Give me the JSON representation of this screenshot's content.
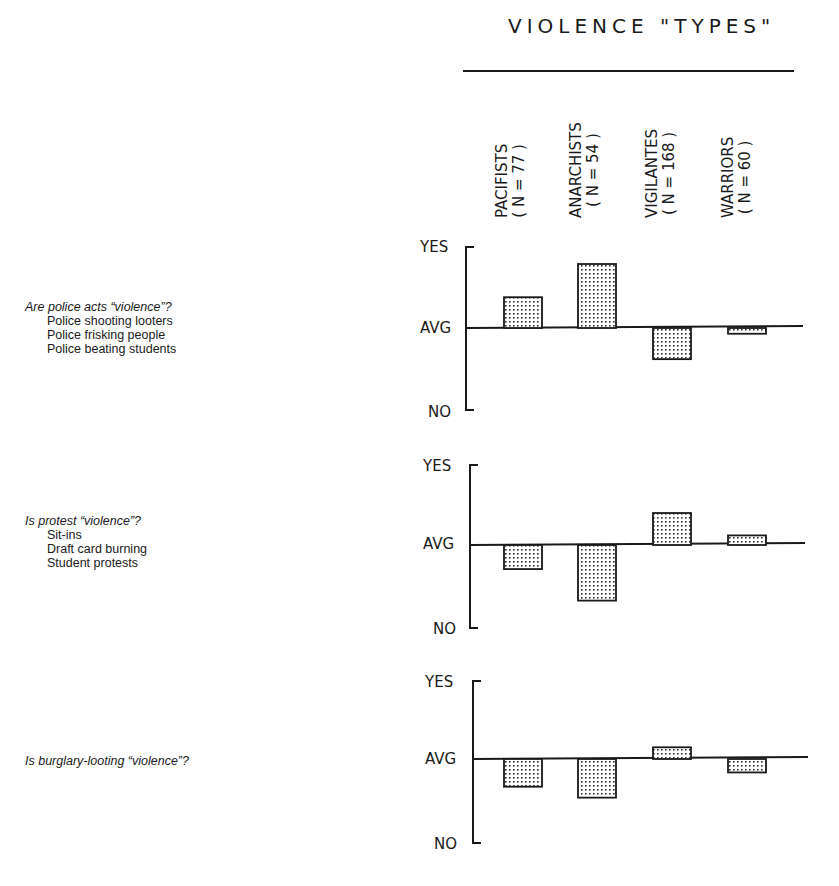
{
  "header": {
    "title": "VIOLENCE \"TYPES\""
  },
  "columns": [
    {
      "name": "PACIFISTS",
      "n": "( N = 77 )"
    },
    {
      "name": "ANARCHISTS",
      "n": "( N = 54 )"
    },
    {
      "name": "VIGILANTES",
      "n": "( N = 168 )"
    },
    {
      "name": "WARRIORS",
      "n": "( N = 60 )"
    }
  ],
  "axis_labels": {
    "yes": "YES",
    "avg": "AVG",
    "no": "NO"
  },
  "panels": [
    {
      "question": "Are police acts “violence”?",
      "items": [
        "Police shooting looters",
        "Police frisking people",
        "Police beating students"
      ]
    },
    {
      "question": "Is protest “violence”?",
      "items": [
        "Sit-ins",
        "Draft card burning",
        "Student protests"
      ]
    },
    {
      "question": "Is burglary-looting “violence”?",
      "items": []
    }
  ],
  "chart_data": [
    {
      "type": "bar",
      "title": "Are police acts \"violence\"?",
      "subtitle": "Police shooting looters; Police frisking people; Police beating students",
      "categories": [
        "Pacifists (N=77)",
        "Anarchists (N=54)",
        "Vigilantes (N=168)",
        "Warriors (N=60)"
      ],
      "values": [
        0.38,
        0.79,
        -0.38,
        -0.07
      ],
      "xlabel": "VIOLENCE \"TYPES\"",
      "ylabel": "",
      "yticks": [
        "NO",
        "AVG",
        "YES"
      ],
      "ylim": [
        -1,
        1
      ],
      "grid": false,
      "legend": "none"
    },
    {
      "type": "bar",
      "title": "Is protest \"violence\"?",
      "subtitle": "Sit-ins; Draft card burning; Student protests",
      "categories": [
        "Pacifists (N=77)",
        "Anarchists (N=54)",
        "Vigilantes (N=168)",
        "Warriors (N=60)"
      ],
      "values": [
        -0.29,
        -0.67,
        0.4,
        0.12
      ],
      "xlabel": "VIOLENCE \"TYPES\"",
      "ylabel": "",
      "yticks": [
        "NO",
        "AVG",
        "YES"
      ],
      "ylim": [
        -1,
        1
      ],
      "grid": false,
      "legend": "none"
    },
    {
      "type": "bar",
      "title": "Is burglary-looting \"violence\"?",
      "categories": [
        "Pacifists (N=77)",
        "Anarchists (N=54)",
        "Vigilantes (N=168)",
        "Warriors (N=60)"
      ],
      "values": [
        -0.33,
        -0.46,
        0.15,
        -0.16
      ],
      "xlabel": "VIOLENCE \"TYPES\"",
      "ylabel": "",
      "yticks": [
        "NO",
        "AVG",
        "YES"
      ],
      "ylim": [
        -1,
        1
      ],
      "grid": false,
      "legend": "none"
    }
  ]
}
